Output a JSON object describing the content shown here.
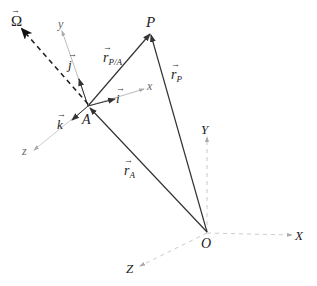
{
  "colors": {
    "main_line": "#333333",
    "dashed_omega": "#222222",
    "local_axes": "#bbbbbb",
    "global_axes": "#cccccc",
    "label": "#222222"
  },
  "points": {
    "P": {
      "label": "P"
    },
    "A": {
      "label": "A"
    },
    "O": {
      "label": "O"
    }
  },
  "vectors": {
    "r_PA": {
      "base": "r",
      "subscript": "P/A"
    },
    "r_P": {
      "base": "r",
      "subscript": "P"
    },
    "r_A": {
      "base": "r",
      "subscript": "A"
    },
    "omega": {
      "label": "Ω"
    },
    "i": {
      "label": "i"
    },
    "j": {
      "label": "j"
    },
    "k": {
      "label": "k"
    }
  },
  "local_axes": {
    "x": "x",
    "y": "y",
    "z": "z"
  },
  "global_axes": {
    "X": "X",
    "Y": "Y",
    "Z": "Z"
  }
}
